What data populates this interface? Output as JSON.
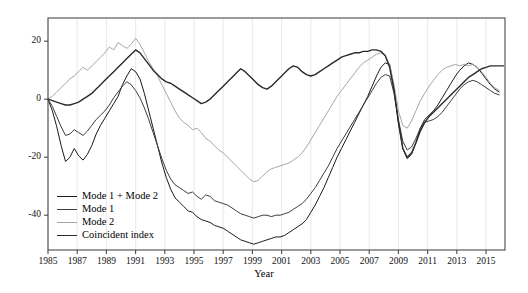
{
  "chart_data": {
    "type": "line",
    "title": "",
    "xlabel": "Year",
    "ylabel": "",
    "xlim": [
      1985.0,
      2016.3
    ],
    "ylim": [
      -52,
      28
    ],
    "grid": "vertical-only",
    "legend_position": "lower-left-inside",
    "xticks": [
      1985,
      1987,
      1989,
      1991,
      1993,
      1995,
      1997,
      1999,
      2001,
      2003,
      2005,
      2007,
      2009,
      2011,
      2013,
      2015
    ],
    "yticks": [
      20,
      0,
      -20,
      -40
    ],
    "xtick_labels": [
      "1985",
      "1987",
      "1989",
      "1991",
      "1993",
      "1995",
      "1997",
      "1999",
      "2001",
      "2003",
      "2005",
      "2007",
      "2009",
      "2011",
      "2013",
      "2015"
    ],
    "ytick_labels": [
      "20",
      "0",
      "-20",
      "-40"
    ],
    "series": [
      {
        "name": "Mode 1 + Mode 2",
        "color": "#1a1a1a",
        "width": 1.0,
        "x": [
          1985.0,
          1985.3,
          1985.6,
          1985.9,
          1986.2,
          1986.5,
          1986.8,
          1987.1,
          1987.4,
          1987.7,
          1988.0,
          1988.3,
          1988.6,
          1988.9,
          1989.2,
          1989.5,
          1989.8,
          1990.1,
          1990.4,
          1990.7,
          1991.0,
          1991.3,
          1991.6,
          1991.9,
          1992.2,
          1992.5,
          1992.8,
          1993.1,
          1993.4,
          1993.7,
          1994.0,
          1994.3,
          1994.6,
          1994.9,
          1995.2,
          1995.5,
          1995.8,
          1996.1,
          1996.4,
          1996.7,
          1997.0,
          1997.3,
          1997.6,
          1997.9,
          1998.2,
          1998.5,
          1998.8,
          1999.1,
          1999.4,
          1999.7,
          2000.0,
          2000.3,
          2000.6,
          2000.9,
          2001.2,
          2001.5,
          2001.8,
          2002.1,
          2002.4,
          2002.7,
          2003.0,
          2003.3,
          2003.6,
          2003.9,
          2004.2,
          2004.5,
          2004.8,
          2005.1,
          2005.4,
          2005.7,
          2006.0,
          2006.3,
          2006.6,
          2006.9,
          2007.2,
          2007.5,
          2007.8,
          2008.1,
          2008.4,
          2008.7,
          2009.0,
          2009.3,
          2009.6,
          2009.9,
          2010.2,
          2010.5,
          2010.8,
          2011.1,
          2011.4,
          2011.7,
          2012.0,
          2012.3,
          2012.6,
          2012.9,
          2013.2,
          2013.5,
          2013.8,
          2014.1,
          2014.4,
          2014.7,
          2015.0,
          2015.3,
          2015.6,
          2015.9
        ],
        "y": [
          0.0,
          -4.0,
          -9.5,
          -16.0,
          -21.5,
          -20.0,
          -17.0,
          -19.5,
          -21.0,
          -19.0,
          -16.0,
          -12.0,
          -9.0,
          -6.5,
          -4.0,
          -1.5,
          1.0,
          5.0,
          8.0,
          10.5,
          9.5,
          7.0,
          2.0,
          -4.0,
          -10.0,
          -16.0,
          -22.0,
          -27.0,
          -31.0,
          -34.0,
          -35.5,
          -37.0,
          -38.5,
          -39.0,
          -40.5,
          -41.5,
          -42.0,
          -42.5,
          -43.5,
          -44.0,
          -44.5,
          -45.5,
          -46.5,
          -47.5,
          -48.5,
          -49.0,
          -49.5,
          -50.0,
          -49.5,
          -49.0,
          -48.5,
          -48.0,
          -47.5,
          -47.5,
          -47.0,
          -46.0,
          -45.0,
          -44.0,
          -43.0,
          -41.5,
          -39.0,
          -36.5,
          -33.5,
          -30.5,
          -27.0,
          -23.5,
          -20.0,
          -17.0,
          -14.0,
          -11.0,
          -8.0,
          -5.0,
          -2.0,
          1.0,
          4.5,
          8.0,
          11.0,
          12.5,
          12.0,
          4.0,
          -8.0,
          -17.0,
          -20.5,
          -19.0,
          -15.0,
          -10.0,
          -7.0,
          -5.5,
          -4.0,
          -2.0,
          0.5,
          3.0,
          5.5,
          8.0,
          10.0,
          11.5,
          12.5,
          12.0,
          11.0,
          9.0,
          7.0,
          5.0,
          3.5,
          2.5
        ]
      },
      {
        "name": "Mode 1",
        "color": "#3d3d3d",
        "width": 1.0,
        "x": [
          1985.0,
          1985.3,
          1985.6,
          1985.9,
          1986.2,
          1986.5,
          1986.8,
          1987.1,
          1987.4,
          1987.7,
          1988.0,
          1988.3,
          1988.6,
          1988.9,
          1989.2,
          1989.5,
          1989.8,
          1990.1,
          1990.4,
          1990.7,
          1991.0,
          1991.3,
          1991.6,
          1991.9,
          1992.2,
          1992.5,
          1992.8,
          1993.1,
          1993.4,
          1993.7,
          1994.0,
          1994.3,
          1994.6,
          1994.9,
          1995.2,
          1995.5,
          1995.8,
          1996.1,
          1996.4,
          1996.7,
          1997.0,
          1997.3,
          1997.6,
          1997.9,
          1998.2,
          1998.5,
          1998.8,
          1999.1,
          1999.4,
          1999.7,
          2000.0,
          2000.3,
          2000.6,
          2000.9,
          2001.2,
          2001.5,
          2001.8,
          2002.1,
          2002.4,
          2002.7,
          2003.0,
          2003.3,
          2003.6,
          2003.9,
          2004.2,
          2004.5,
          2004.8,
          2005.1,
          2005.4,
          2005.7,
          2006.0,
          2006.3,
          2006.6,
          2006.9,
          2007.2,
          2007.5,
          2007.8,
          2008.1,
          2008.4,
          2008.7,
          2009.0,
          2009.3,
          2009.6,
          2009.9,
          2010.2,
          2010.5,
          2010.8,
          2011.1,
          2011.4,
          2011.7,
          2012.0,
          2012.3,
          2012.6,
          2012.9,
          2013.2,
          2013.5,
          2013.8,
          2014.1,
          2014.4,
          2014.7,
          2015.0,
          2015.3,
          2015.6,
          2015.9
        ],
        "y": [
          0.0,
          -2.5,
          -6.0,
          -9.5,
          -12.5,
          -12.0,
          -10.5,
          -11.5,
          -12.5,
          -11.0,
          -9.0,
          -7.0,
          -5.5,
          -4.0,
          -2.0,
          0.5,
          2.5,
          4.5,
          6.0,
          5.0,
          3.0,
          0.5,
          -3.0,
          -7.0,
          -11.5,
          -16.0,
          -20.5,
          -24.5,
          -27.5,
          -29.5,
          -30.5,
          -31.5,
          -32.5,
          -32.0,
          -33.5,
          -34.5,
          -33.0,
          -33.5,
          -35.0,
          -35.5,
          -36.0,
          -36.5,
          -37.5,
          -38.5,
          -39.5,
          -40.0,
          -40.5,
          -41.0,
          -40.5,
          -40.0,
          -40.0,
          -40.5,
          -40.0,
          -40.0,
          -39.5,
          -39.0,
          -38.0,
          -37.0,
          -36.0,
          -34.5,
          -32.5,
          -30.5,
          -28.0,
          -25.5,
          -23.0,
          -20.0,
          -17.0,
          -14.5,
          -12.0,
          -9.5,
          -7.0,
          -4.5,
          -2.0,
          0.5,
          3.0,
          5.5,
          7.5,
          8.5,
          8.0,
          2.0,
          -7.0,
          -14.5,
          -17.5,
          -16.5,
          -13.5,
          -10.0,
          -8.0,
          -7.5,
          -7.0,
          -6.0,
          -4.5,
          -2.5,
          -0.5,
          1.5,
          3.5,
          5.0,
          6.0,
          6.5,
          6.0,
          5.0,
          4.0,
          3.0,
          2.0,
          1.5
        ]
      },
      {
        "name": "Mode 2",
        "color": "#a6a6a6",
        "width": 1.0,
        "x": [
          1985.0,
          1985.3,
          1985.6,
          1985.9,
          1986.2,
          1986.5,
          1986.8,
          1987.1,
          1987.4,
          1987.7,
          1988.0,
          1988.3,
          1988.6,
          1988.9,
          1989.2,
          1989.5,
          1989.8,
          1990.1,
          1990.4,
          1990.7,
          1991.0,
          1991.3,
          1991.6,
          1991.9,
          1992.2,
          1992.5,
          1992.8,
          1993.1,
          1993.4,
          1993.7,
          1994.0,
          1994.3,
          1994.6,
          1994.9,
          1995.2,
          1995.5,
          1995.8,
          1996.1,
          1996.4,
          1996.7,
          1997.0,
          1997.3,
          1997.6,
          1997.9,
          1998.2,
          1998.5,
          1998.8,
          1999.1,
          1999.4,
          1999.7,
          2000.0,
          2000.3,
          2000.6,
          2000.9,
          2001.2,
          2001.5,
          2001.8,
          2002.1,
          2002.4,
          2002.7,
          2003.0,
          2003.3,
          2003.6,
          2003.9,
          2004.2,
          2004.5,
          2004.8,
          2005.1,
          2005.4,
          2005.7,
          2006.0,
          2006.3,
          2006.6,
          2006.9,
          2007.2,
          2007.5,
          2007.8,
          2008.1,
          2008.4,
          2008.7,
          2009.0,
          2009.3,
          2009.6,
          2009.9,
          2010.2,
          2010.5,
          2010.8,
          2011.1,
          2011.4,
          2011.7,
          2012.0,
          2012.3,
          2012.6,
          2012.9,
          2013.2,
          2013.5,
          2013.8,
          2014.1,
          2014.4,
          2014.7,
          2015.0,
          2015.3,
          2015.6,
          2015.9
        ],
        "y": [
          0.0,
          1.0,
          2.5,
          4.0,
          5.5,
          7.0,
          8.0,
          9.5,
          11.0,
          10.0,
          11.5,
          13.0,
          14.5,
          16.0,
          18.0,
          17.0,
          19.5,
          18.5,
          17.5,
          19.0,
          21.0,
          19.0,
          16.0,
          13.0,
          10.5,
          8.0,
          5.0,
          2.0,
          -1.0,
          -4.0,
          -6.5,
          -8.0,
          -9.0,
          -10.5,
          -10.0,
          -11.5,
          -13.5,
          -14.5,
          -16.0,
          -17.5,
          -18.5,
          -20.0,
          -21.5,
          -23.0,
          -24.5,
          -26.0,
          -27.5,
          -28.5,
          -28.0,
          -26.5,
          -25.0,
          -24.0,
          -23.5,
          -23.0,
          -22.5,
          -22.0,
          -21.0,
          -20.0,
          -18.5,
          -16.5,
          -14.0,
          -11.5,
          -9.0,
          -6.5,
          -4.0,
          -1.5,
          1.0,
          3.0,
          5.0,
          7.0,
          9.0,
          11.0,
          12.5,
          13.5,
          14.5,
          15.5,
          16.0,
          15.0,
          12.0,
          5.0,
          -4.0,
          -9.0,
          -10.0,
          -7.5,
          -4.0,
          -0.5,
          2.0,
          4.5,
          6.5,
          8.5,
          10.0,
          11.0,
          11.5,
          12.0,
          11.5,
          12.0,
          11.5,
          12.0,
          11.0,
          9.5,
          7.5,
          5.5,
          4.0,
          3.0
        ]
      },
      {
        "name": "Coincident index",
        "color": "#2b2b2b",
        "width": 1.4,
        "x": [
          1985.0,
          1985.3,
          1985.6,
          1985.9,
          1986.2,
          1986.5,
          1986.8,
          1987.1,
          1987.4,
          1987.7,
          1988.0,
          1988.3,
          1988.6,
          1988.9,
          1989.2,
          1989.5,
          1989.8,
          1990.1,
          1990.4,
          1990.7,
          1991.0,
          1991.3,
          1991.6,
          1991.9,
          1992.2,
          1992.5,
          1992.8,
          1993.1,
          1993.4,
          1993.7,
          1994.0,
          1994.3,
          1994.6,
          1994.9,
          1995.2,
          1995.5,
          1995.8,
          1996.1,
          1996.4,
          1996.7,
          1997.0,
          1997.3,
          1997.6,
          1997.9,
          1998.2,
          1998.5,
          1998.8,
          1999.1,
          1999.4,
          1999.7,
          2000.0,
          2000.3,
          2000.6,
          2000.9,
          2001.2,
          2001.5,
          2001.8,
          2002.1,
          2002.4,
          2002.7,
          2003.0,
          2003.3,
          2003.6,
          2003.9,
          2004.2,
          2004.5,
          2004.8,
          2005.1,
          2005.4,
          2005.7,
          2006.0,
          2006.3,
          2006.6,
          2006.9,
          2007.2,
          2007.5,
          2007.8,
          2008.1,
          2008.4,
          2008.7,
          2009.0,
          2009.3,
          2009.6,
          2009.9,
          2010.2,
          2010.5,
          2010.8,
          2011.1,
          2011.4,
          2011.7,
          2012.0,
          2012.3,
          2012.6,
          2012.9,
          2013.2,
          2013.5,
          2013.8,
          2014.1,
          2014.4,
          2014.7,
          2015.0,
          2015.3,
          2015.6,
          2015.9,
          2016.2
        ],
        "y": [
          0.0,
          -0.5,
          -1.0,
          -1.5,
          -2.0,
          -2.0,
          -1.5,
          -1.0,
          0.0,
          1.0,
          2.0,
          3.5,
          5.0,
          6.5,
          8.0,
          9.5,
          11.0,
          12.5,
          14.0,
          15.5,
          17.0,
          16.0,
          14.0,
          12.0,
          10.0,
          8.5,
          7.0,
          6.0,
          5.5,
          4.5,
          3.5,
          2.5,
          1.5,
          0.5,
          -0.5,
          -1.5,
          -1.0,
          0.0,
          1.5,
          3.0,
          4.5,
          6.0,
          7.5,
          9.0,
          10.5,
          9.5,
          8.0,
          6.5,
          5.0,
          4.0,
          3.5,
          4.5,
          6.0,
          7.5,
          9.0,
          10.5,
          11.5,
          11.0,
          9.5,
          8.5,
          8.0,
          8.5,
          9.5,
          10.5,
          11.5,
          12.5,
          13.5,
          14.5,
          15.0,
          15.5,
          16.0,
          16.0,
          16.5,
          16.5,
          17.0,
          17.0,
          16.5,
          15.0,
          11.0,
          3.0,
          -8.0,
          -17.0,
          -20.0,
          -18.5,
          -15.0,
          -11.0,
          -8.0,
          -6.0,
          -4.5,
          -3.0,
          -1.5,
          0.0,
          1.5,
          3.0,
          4.5,
          6.0,
          7.5,
          8.5,
          9.5,
          10.5,
          11.0,
          11.5,
          11.5,
          11.5,
          11.5
        ]
      }
    ]
  },
  "legend": {
    "items": [
      {
        "label": "Mode 1 + Mode 2",
        "color": "#1a1a1a",
        "width": 1.0
      },
      {
        "label": "Mode 1",
        "color": "#3d3d3d",
        "width": 1.0
      },
      {
        "label": "Mode 2",
        "color": "#a6a6a6",
        "width": 1.0
      },
      {
        "label": "Coincident index",
        "color": "#2b2b2b",
        "width": 1.4
      }
    ]
  },
  "axes": {
    "x_title": "Year",
    "frame_color": "#4a4a4a",
    "gridline_color": "#ebebeb",
    "background": "#ffffff"
  }
}
